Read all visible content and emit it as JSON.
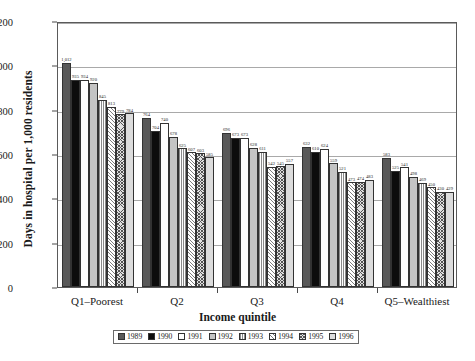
{
  "chart_data": {
    "type": "bar",
    "title": "",
    "xlabel": "Income quintile",
    "ylabel": "Days in hospital per 1,000 residents",
    "ylim": [
      0,
      1200
    ],
    "yticks": [
      "0",
      "200",
      "400",
      "600",
      "800",
      "1,000",
      "1,200"
    ],
    "ytick_values": [
      0,
      200,
      400,
      600,
      800,
      1000,
      1200
    ],
    "grid": true,
    "legend_position": "bottom",
    "categories": [
      "Q1–Poorest",
      "Q2",
      "Q3",
      "Q4",
      "Q5–Wealthiest"
    ],
    "series": [
      {
        "name": "1989",
        "values": [
          1012,
          764,
          696,
          632,
          583
        ],
        "labels": [
          "1,012",
          "764",
          "696",
          "632",
          "583"
        ]
      },
      {
        "name": "1990",
        "values": [
          935,
          704,
          673,
          610,
          525
        ],
        "labels": [
          "935",
          "704",
          "673",
          "610",
          "525"
        ]
      },
      {
        "name": "1991",
        "values": [
          934,
          740,
          673,
          624,
          541
        ],
        "labels": [
          "934",
          "740",
          "673",
          "624",
          "541"
        ]
      },
      {
        "name": "1992",
        "values": [
          920,
          678,
          628,
          559,
          498
        ],
        "labels": [
          "920",
          "678",
          "628",
          "559",
          "498"
        ]
      },
      {
        "name": "1993",
        "values": [
          845,
          625,
          611,
          521,
          469
        ],
        "labels": [
          "845",
          "625",
          "611",
          "521",
          "469"
        ]
      },
      {
        "name": "1994",
        "values": [
          813,
          607,
          542,
          473,
          450
        ],
        "labels": [
          "813",
          "607",
          "542",
          "473",
          "450"
        ]
      },
      {
        "name": "1995",
        "values": [
          779,
          603,
          545,
          474,
          430
        ],
        "labels": [
          "779",
          "603",
          "545",
          "474",
          "430"
        ]
      },
      {
        "name": "1996",
        "values": [
          784,
          585,
          557,
          483,
          429
        ],
        "labels": [
          "784",
          "585",
          "557",
          "483",
          "429"
        ]
      }
    ]
  },
  "legend": {
    "entries": [
      {
        "label": "1989",
        "swatch": "dark-gray-solid"
      },
      {
        "label": "1990",
        "swatch": "black-solid"
      },
      {
        "label": "1991",
        "swatch": "white-solid"
      },
      {
        "label": "1992",
        "swatch": "light-gray-solid"
      },
      {
        "label": "1993",
        "swatch": "vertical-hatch"
      },
      {
        "label": "1994",
        "swatch": "diagonal-hatch"
      },
      {
        "label": "1995",
        "swatch": "cross-hatch"
      },
      {
        "label": "1996",
        "swatch": "pale-gray-solid"
      }
    ]
  }
}
